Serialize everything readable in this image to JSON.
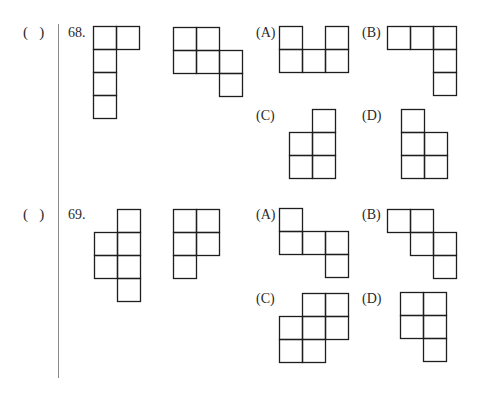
{
  "problems": [
    {
      "answer_blank": "(   )",
      "number": "68.",
      "given_shapes": [
        {
          "cells": [
            [
              0,
              0
            ],
            [
              1,
              0
            ],
            [
              0,
              1
            ],
            [
              0,
              2
            ],
            [
              0,
              3
            ]
          ]
        },
        {
          "cells": [
            [
              0,
              0
            ],
            [
              1,
              0
            ],
            [
              0,
              1
            ],
            [
              1,
              1
            ],
            [
              2,
              1
            ],
            [
              2,
              2
            ]
          ]
        }
      ],
      "options": [
        {
          "label": "(A)",
          "cells": [
            [
              0,
              0
            ],
            [
              2,
              0
            ],
            [
              0,
              1
            ],
            [
              1,
              1
            ],
            [
              2,
              1
            ]
          ]
        },
        {
          "label": "(B)",
          "cells": [
            [
              0,
              0
            ],
            [
              1,
              0
            ],
            [
              2,
              0
            ],
            [
              2,
              1
            ],
            [
              2,
              2
            ]
          ]
        },
        {
          "label": "(C)",
          "cells": [
            [
              1,
              0
            ],
            [
              0,
              1
            ],
            [
              1,
              1
            ],
            [
              0,
              2
            ],
            [
              1,
              2
            ]
          ]
        },
        {
          "label": "(D)",
          "cells": [
            [
              0,
              0
            ],
            [
              0,
              1
            ],
            [
              1,
              1
            ],
            [
              0,
              2
            ],
            [
              1,
              2
            ]
          ]
        }
      ]
    },
    {
      "answer_blank": "(   )",
      "number": "69.",
      "given_shapes": [
        {
          "cells": [
            [
              1,
              0
            ],
            [
              0,
              1
            ],
            [
              1,
              1
            ],
            [
              0,
              2
            ],
            [
              1,
              2
            ],
            [
              1,
              3
            ]
          ]
        },
        {
          "cells": [
            [
              0,
              0
            ],
            [
              1,
              0
            ],
            [
              0,
              1
            ],
            [
              1,
              1
            ],
            [
              0,
              2
            ]
          ]
        }
      ],
      "options": [
        {
          "label": "(A)",
          "cells": [
            [
              0,
              0
            ],
            [
              0,
              1
            ],
            [
              1,
              1
            ],
            [
              2,
              1
            ],
            [
              2,
              2
            ]
          ]
        },
        {
          "label": "(B)",
          "cells": [
            [
              0,
              0
            ],
            [
              1,
              0
            ],
            [
              1,
              1
            ],
            [
              2,
              1
            ],
            [
              2,
              2
            ]
          ]
        },
        {
          "label": "(C)",
          "cells": [
            [
              1,
              0
            ],
            [
              2,
              0
            ],
            [
              0,
              1
            ],
            [
              1,
              1
            ],
            [
              2,
              1
            ],
            [
              0,
              2
            ],
            [
              1,
              2
            ]
          ]
        },
        {
          "label": "(D)",
          "cells": [
            [
              0,
              0
            ],
            [
              1,
              0
            ],
            [
              0,
              1
            ],
            [
              1,
              1
            ],
            [
              1,
              2
            ]
          ]
        }
      ]
    }
  ]
}
